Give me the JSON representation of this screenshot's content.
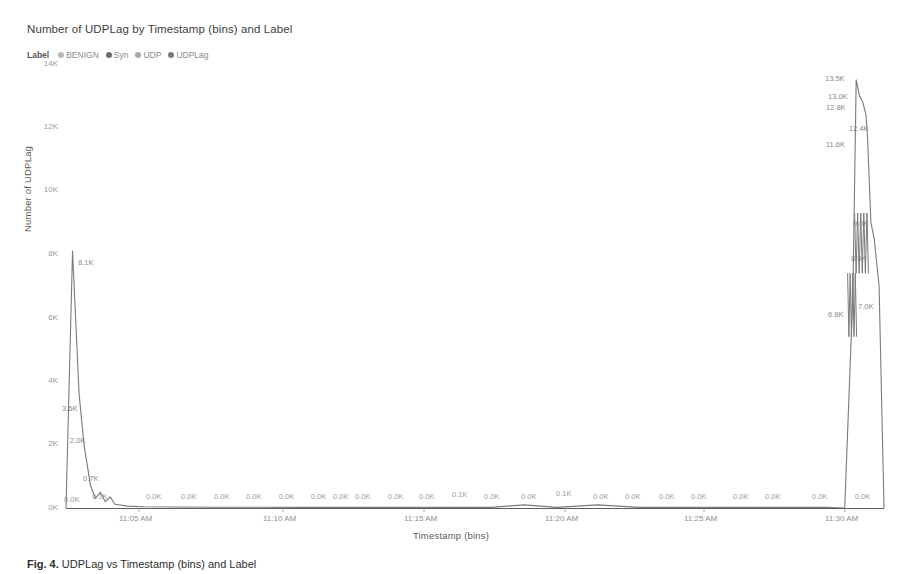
{
  "chart_title": "Number of UDPLag by Timestamp (bins) and Label",
  "legend": {
    "title": "Label",
    "items": [
      {
        "label": "BENIGN",
        "color": "#b9b9b9",
        "marker": "legend-dot-icon"
      },
      {
        "label": "Syn",
        "color": "#6d6d6d",
        "marker": "legend-dot-icon"
      },
      {
        "label": "UDP",
        "color": "#a8a8a8",
        "marker": "legend-dot-icon"
      },
      {
        "label": "UDPLag",
        "color": "#7a7a7a",
        "marker": "legend-dot-icon"
      }
    ]
  },
  "axes": {
    "y_title": "Number of UDPLag",
    "x_title": "Timestamp (bins)",
    "y_ticks": [
      "0K",
      "2K",
      "4K",
      "6K",
      "8K",
      "10K",
      "12K",
      "14K"
    ],
    "x_ticks": [
      "11:05 AM",
      "11:10 AM",
      "11:15 AM",
      "11:20 AM",
      "11:25 AM",
      "11:30 AM"
    ]
  },
  "caption": {
    "lead": "Fig. 4.",
    "text": " UDPLag vs Timestamp (bins) and Label"
  },
  "chart_data": {
    "type": "line",
    "title": "Number of UDPLag by Timestamp (bins) and Label",
    "xlabel": "Timestamp (bins)",
    "ylabel": "Number of UDPLag",
    "ylim": [
      0,
      14000
    ],
    "y_ticks": [
      0,
      2000,
      4000,
      6000,
      8000,
      10000,
      12000,
      14000
    ],
    "y_tick_labels": [
      "0K",
      "2K",
      "4K",
      "6K",
      "8K",
      "10K",
      "12K",
      "14K"
    ],
    "x_tick_labels": [
      "11:05 AM",
      "11:10 AM",
      "11:15 AM",
      "11:20 AM",
      "11:25 AM",
      "11:30 AM"
    ],
    "grid": false,
    "legend_position": "top-left",
    "series": [
      {
        "name": "UDPLag",
        "color": "#7a7a7a",
        "points": [
          {
            "x": 0.0,
            "y": 0,
            "label": "0.0K"
          },
          {
            "x": 0.008,
            "y": 8100,
            "label": "8.1K"
          },
          {
            "x": 0.016,
            "y": 3600,
            "label": "3.6K"
          },
          {
            "x": 0.022,
            "y": 2000,
            "label": "2.0K"
          },
          {
            "x": 0.03,
            "y": 700,
            "label": "0.7K"
          },
          {
            "x": 0.036,
            "y": 300,
            "label": ""
          },
          {
            "x": 0.042,
            "y": 500,
            "label": ""
          },
          {
            "x": 0.048,
            "y": 200,
            "label": ""
          },
          {
            "x": 0.054,
            "y": 350,
            "label": ""
          },
          {
            "x": 0.06,
            "y": 120,
            "label": "0.1K"
          },
          {
            "x": 0.075,
            "y": 60,
            "label": ""
          },
          {
            "x": 0.095,
            "y": 40,
            "label": "0.0K"
          },
          {
            "x": 0.135,
            "y": 30,
            "label": "0.0K"
          },
          {
            "x": 0.18,
            "y": 25,
            "label": "0.0K"
          },
          {
            "x": 0.23,
            "y": 25,
            "label": "0.0K"
          },
          {
            "x": 0.29,
            "y": 20,
            "label": "0.0K"
          },
          {
            "x": 0.35,
            "y": 20,
            "label": "0.0K"
          },
          {
            "x": 0.39,
            "y": 20,
            "label": "0.0K"
          },
          {
            "x": 0.43,
            "y": 20,
            "label": "0.0K"
          },
          {
            "x": 0.48,
            "y": 20,
            "label": "0.0K"
          },
          {
            "x": 0.52,
            "y": 20,
            "label": "0.0K"
          },
          {
            "x": 0.56,
            "y": 100,
            "label": "0.1K"
          },
          {
            "x": 0.6,
            "y": 20,
            "label": "0.0K"
          },
          {
            "x": 0.65,
            "y": 100,
            "label": "0.1K"
          },
          {
            "x": 0.7,
            "y": 20,
            "label": "0.0K"
          },
          {
            "x": 0.75,
            "y": 20,
            "label": "0.0K"
          },
          {
            "x": 0.8,
            "y": 20,
            "label": "0.0K"
          },
          {
            "x": 0.85,
            "y": 20,
            "label": "0.0K"
          },
          {
            "x": 0.9,
            "y": 20,
            "label": "0.0K"
          },
          {
            "x": 0.93,
            "y": 20,
            "label": "0.0K"
          },
          {
            "x": 0.952,
            "y": 0,
            "label": "0.0K"
          },
          {
            "x": 0.962,
            "y": 6800,
            "label": "6.8K"
          },
          {
            "x": 0.966,
            "y": 13500,
            "label": "13.5K"
          },
          {
            "x": 0.97,
            "y": 13000,
            "label": "13.0K"
          },
          {
            "x": 0.974,
            "y": 12800,
            "label": "12.8K"
          },
          {
            "x": 0.978,
            "y": 12400,
            "label": "12.4K"
          },
          {
            "x": 0.98,
            "y": 11600,
            "label": "11.6K"
          },
          {
            "x": 0.984,
            "y": 9000,
            "label": "9.0K"
          },
          {
            "x": 0.988,
            "y": 8500,
            "label": "8.5K"
          },
          {
            "x": 0.994,
            "y": 7000,
            "label": "7.0K"
          },
          {
            "x": 1.0,
            "y": 0,
            "label": "0.0K"
          }
        ]
      }
    ],
    "annotations": [
      {
        "text": "8.1K",
        "x": 0.008,
        "y": 8100
      },
      {
        "text": "3.6K",
        "x": 0.016,
        "y": 3600
      },
      {
        "text": "2.0K",
        "x": 0.022,
        "y": 2000
      },
      {
        "text": "0.7K",
        "x": 0.03,
        "y": 700
      },
      {
        "text": "13.5K",
        "x": 0.966,
        "y": 13500
      },
      {
        "text": "13.0K",
        "x": 0.97,
        "y": 13000
      },
      {
        "text": "12.8K",
        "x": 0.974,
        "y": 12800
      },
      {
        "text": "12.4K",
        "x": 0.978,
        "y": 12400
      },
      {
        "text": "11.6K",
        "x": 0.98,
        "y": 11600
      },
      {
        "text": "9.0K",
        "x": 0.984,
        "y": 9000
      },
      {
        "text": "8.5K",
        "x": 0.988,
        "y": 8500
      },
      {
        "text": "7.0K",
        "x": 0.994,
        "y": 7000
      },
      {
        "text": "6.8K",
        "x": 0.962,
        "y": 6800
      }
    ]
  },
  "ytick_positions": [
    {
      "label": "14K",
      "top": 64
    },
    {
      "label": "12K",
      "top": 127
    },
    {
      "label": "10K",
      "top": 190
    },
    {
      "label": "8K",
      "top": 254
    },
    {
      "label": "6K",
      "top": 318
    },
    {
      "label": "4K",
      "top": 381
    },
    {
      "label": "2K",
      "top": 444
    },
    {
      "label": "0K",
      "top": 508
    }
  ],
  "xtick_positions": [
    {
      "label": "11:05 AM",
      "left": 139
    },
    {
      "label": "11:10 AM",
      "left": 283
    },
    {
      "label": "11:15 AM",
      "left": 424
    },
    {
      "label": "11:20 AM",
      "left": 565
    },
    {
      "label": "11:25 AM",
      "left": 704
    },
    {
      "label": "11:30 AM",
      "left": 845
    }
  ],
  "baseline_labels": [
    {
      "label": "0.0K",
      "left": 64,
      "top": 495
    },
    {
      "label": "0.1K",
      "left": 92,
      "top": 492
    },
    {
      "label": "0.0K",
      "left": 146,
      "top": 492
    },
    {
      "label": "0.0K",
      "left": 181,
      "top": 492
    },
    {
      "label": "0.0K",
      "left": 214,
      "top": 492
    },
    {
      "label": "0.0K",
      "left": 246,
      "top": 492
    },
    {
      "label": "0.0K",
      "left": 279,
      "top": 492
    },
    {
      "label": "0.0K",
      "left": 311,
      "top": 492
    },
    {
      "label": "0.0K",
      "left": 333,
      "top": 492
    },
    {
      "label": "0.0K",
      "left": 355,
      "top": 492
    },
    {
      "label": "0.0K",
      "left": 388,
      "top": 492
    },
    {
      "label": "0.0K",
      "left": 419,
      "top": 492
    },
    {
      "label": "0.1K",
      "left": 452,
      "top": 490
    },
    {
      "label": "0.0K",
      "left": 484,
      "top": 492
    },
    {
      "label": "0.0K",
      "left": 521,
      "top": 492
    },
    {
      "label": "0.1K",
      "left": 556,
      "top": 489
    },
    {
      "label": "0.0K",
      "left": 593,
      "top": 492
    },
    {
      "label": "0.0K",
      "left": 625,
      "top": 492
    },
    {
      "label": "0.0K",
      "left": 659,
      "top": 492
    },
    {
      "label": "0.0K",
      "left": 691,
      "top": 492
    },
    {
      "label": "0.0K",
      "left": 733,
      "top": 492
    },
    {
      "label": "0.0K",
      "left": 765,
      "top": 492
    },
    {
      "label": "0.0K",
      "left": 812,
      "top": 492
    },
    {
      "label": "0.0K",
      "left": 855,
      "top": 492
    }
  ],
  "peak_labels": [
    {
      "label": "8.1K",
      "left": 78,
      "top": 258
    },
    {
      "label": "3.6K",
      "left": 62,
      "top": 404
    },
    {
      "label": "2.0K",
      "left": 70,
      "top": 436
    },
    {
      "label": "0.7K",
      "left": 83,
      "top": 474
    },
    {
      "label": "13.5K",
      "left": 825,
      "top": 74
    },
    {
      "label": "13.0K",
      "left": 828,
      "top": 92
    },
    {
      "label": "12.8K",
      "left": 826,
      "top": 103
    },
    {
      "label": "12.4K",
      "left": 849,
      "top": 124
    },
    {
      "label": "11.6K",
      "left": 826,
      "top": 140
    },
    {
      "label": "9.0K",
      "left": 853,
      "top": 219
    },
    {
      "label": "8.5K",
      "left": 851,
      "top": 254
    },
    {
      "label": "7.0K",
      "left": 858,
      "top": 302
    },
    {
      "label": "6.8K",
      "left": 828,
      "top": 310
    }
  ],
  "colors": {
    "line": "#7a7a7a",
    "axis": "#5a5a5a",
    "tick_text": "#9a9a9a",
    "title_text": "#3d3d3d"
  }
}
